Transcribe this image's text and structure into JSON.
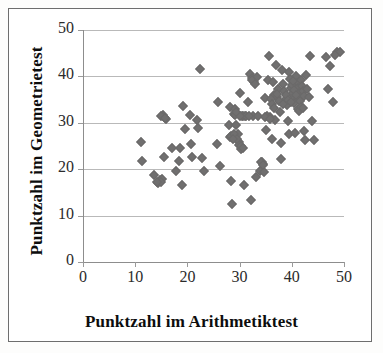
{
  "chart_data": {
    "type": "scatter",
    "title": "",
    "xlabel": "Punktzahl im Arithmetiktest",
    "ylabel": "Punktzahl im Geometrietest",
    "xlim": [
      0,
      50
    ],
    "ylim": [
      0,
      50
    ],
    "xticks": [
      0,
      10,
      20,
      30,
      40,
      50
    ],
    "yticks": [
      0,
      10,
      20,
      30,
      40,
      50
    ],
    "xtick_labels": [
      "0",
      "10",
      "20",
      "30",
      "40",
      "50"
    ],
    "ytick_labels": [
      "0",
      "10",
      "20",
      "30",
      "40",
      "50"
    ],
    "grid": "horizontal",
    "legend": "none",
    "marker": "diamond",
    "marker_color": "#706f6f",
    "gridline_color": "#b9b9b9",
    "axis_color": "#8d8d8d",
    "border_color": "#6e6e6e",
    "background": "#ffffff",
    "n_points": 148,
    "points": [
      [
        11.2,
        25.8
      ],
      [
        11.3,
        21.7
      ],
      [
        13.6,
        18.8
      ],
      [
        14.4,
        17.0
      ],
      [
        14.8,
        17.6
      ],
      [
        15.2,
        17.9
      ],
      [
        15.3,
        31.6
      ],
      [
        15.6,
        31.2
      ],
      [
        15.9,
        30.8
      ],
      [
        15.5,
        22.7
      ],
      [
        17.0,
        24.6
      ],
      [
        17.9,
        19.6
      ],
      [
        18.3,
        21.8
      ],
      [
        18.6,
        24.5
      ],
      [
        19.0,
        16.7
      ],
      [
        19.2,
        33.6
      ],
      [
        19.6,
        28.7
      ],
      [
        20.5,
        31.6
      ],
      [
        20.6,
        25.5
      ],
      [
        20.8,
        22.6
      ],
      [
        21.9,
        30.7
      ],
      [
        22.0,
        28.8
      ],
      [
        22.5,
        41.5
      ],
      [
        22.8,
        22.5
      ],
      [
        23.2,
        19.6
      ],
      [
        25.6,
        25.5
      ],
      [
        25.8,
        34.5
      ],
      [
        26.2,
        20.6
      ],
      [
        27.9,
        29.5
      ],
      [
        28.1,
        33.5
      ],
      [
        28.2,
        26.9
      ],
      [
        28.3,
        27.2
      ],
      [
        28.4,
        17.4
      ],
      [
        28.6,
        12.5
      ],
      [
        29.0,
        32.0
      ],
      [
        29.1,
        33.0
      ],
      [
        29.2,
        31.6
      ],
      [
        29.4,
        29.5
      ],
      [
        29.6,
        27.5
      ],
      [
        29.8,
        25.8
      ],
      [
        29.9,
        25.3
      ],
      [
        30.0,
        36.5
      ],
      [
        30.2,
        24.4
      ],
      [
        30.4,
        31.5
      ],
      [
        30.6,
        31.5
      ],
      [
        30.8,
        16.5
      ],
      [
        31.0,
        31.5
      ],
      [
        31.3,
        31.4
      ],
      [
        31.6,
        34.5
      ],
      [
        32.0,
        40.5
      ],
      [
        32.2,
        13.4
      ],
      [
        32.3,
        39.6
      ],
      [
        32.6,
        31.4
      ],
      [
        32.8,
        38.8
      ],
      [
        33.1,
        18.4
      ],
      [
        33.4,
        39.9
      ],
      [
        33.6,
        31.4
      ],
      [
        34.0,
        19.6
      ],
      [
        34.2,
        21.5
      ],
      [
        34.4,
        21.2
      ],
      [
        34.6,
        19.3
      ],
      [
        34.8,
        35.4
      ],
      [
        35.0,
        28.5
      ],
      [
        35.2,
        31.4
      ],
      [
        35.4,
        39.3
      ],
      [
        35.6,
        44.4
      ],
      [
        35.9,
        31.3
      ],
      [
        36.2,
        26.5
      ],
      [
        36.4,
        38.8
      ],
      [
        36.6,
        36.0
      ],
      [
        36.8,
        30.6
      ],
      [
        37.0,
        42.4
      ],
      [
        37.2,
        35.6
      ],
      [
        37.3,
        37.2
      ],
      [
        37.5,
        34.6
      ],
      [
        37.7,
        32.4
      ],
      [
        37.9,
        25.6
      ],
      [
        38.0,
        22.3
      ],
      [
        38.2,
        41.4
      ],
      [
        38.4,
        38.4
      ],
      [
        38.6,
        36.8
      ],
      [
        38.8,
        35.2
      ],
      [
        39.0,
        33.8
      ],
      [
        39.2,
        30.4
      ],
      [
        39.4,
        27.6
      ],
      [
        39.5,
        41.0
      ],
      [
        39.7,
        39.4
      ],
      [
        39.9,
        37.6
      ],
      [
        40.0,
        36.2
      ],
      [
        40.2,
        35.0
      ],
      [
        40.4,
        34.2
      ],
      [
        40.6,
        27.8
      ],
      [
        40.8,
        40.0
      ],
      [
        41.0,
        38.6
      ],
      [
        41.2,
        37.4
      ],
      [
        41.4,
        36.4
      ],
      [
        41.5,
        35.4
      ],
      [
        41.6,
        34.8
      ],
      [
        41.8,
        39.2
      ],
      [
        42.0,
        38.0
      ],
      [
        42.1,
        36.8
      ],
      [
        42.3,
        35.8
      ],
      [
        42.4,
        28.3
      ],
      [
        42.6,
        26.4
      ],
      [
        42.8,
        40.3
      ],
      [
        43.0,
        37.2
      ],
      [
        43.2,
        35.6
      ],
      [
        43.4,
        44.3
      ],
      [
        43.9,
        30.4
      ],
      [
        44.3,
        26.4
      ],
      [
        46.5,
        44.2
      ],
      [
        47.0,
        37.3
      ],
      [
        47.4,
        42.3
      ],
      [
        47.8,
        34.4
      ],
      [
        48.6,
        45.2
      ],
      [
        49.2,
        45.3
      ],
      [
        48.3,
        44.7
      ],
      [
        36.0,
        35.2
      ],
      [
        36.3,
        34.0
      ],
      [
        36.5,
        33.2
      ],
      [
        37.1,
        36.3
      ],
      [
        38.3,
        34.0
      ],
      [
        38.9,
        36.0
      ],
      [
        39.3,
        35.0
      ],
      [
        39.8,
        34.4
      ],
      [
        40.1,
        38.2
      ],
      [
        40.5,
        37.0
      ],
      [
        40.9,
        36.0
      ],
      [
        41.1,
        33.0
      ],
      [
        41.3,
        32.5
      ],
      [
        41.7,
        33.4
      ],
      [
        42.2,
        33.2
      ],
      [
        40.3,
        39.0
      ],
      [
        34.9,
        31.2
      ],
      [
        35.8,
        30.8
      ],
      [
        30.1,
        31.5
      ],
      [
        31.8,
        31.5
      ],
      [
        29.3,
        32.4
      ],
      [
        28.9,
        27.6
      ],
      [
        29.5,
        26.6
      ],
      [
        28.8,
        26.5
      ],
      [
        30.3,
        24.9
      ],
      [
        30.7,
        24.6
      ],
      [
        15.0,
        31.4
      ],
      [
        15.8,
        31.0
      ],
      [
        14.9,
        17.2
      ],
      [
        14.2,
        17.3
      ],
      [
        34.1,
        21.6
      ],
      [
        34.5,
        21.0
      ],
      [
        32.4,
        39.2
      ],
      [
        33.0,
        38.4
      ]
    ]
  }
}
